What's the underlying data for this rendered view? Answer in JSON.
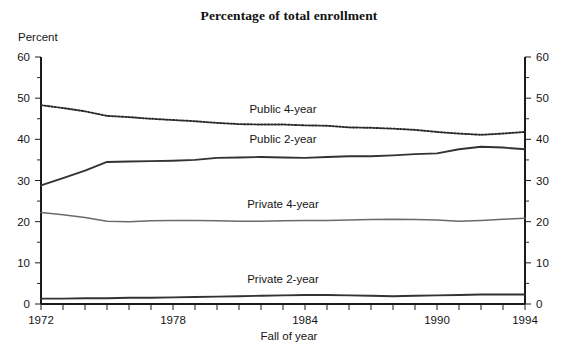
{
  "figure": {
    "title": "Percentage of total enrollment",
    "y_axis_unit_label": "Percent",
    "x_axis_title": "Fall of year"
  },
  "chart_data": {
    "type": "line",
    "title": "Percentage of total enrollment",
    "xlabel": "Fall of year",
    "ylabel": "Percent",
    "xlim": [
      1972,
      1994
    ],
    "ylim": [
      0,
      60
    ],
    "grid": false,
    "legend_position": "inline-labels",
    "y_ticks": [
      0,
      10,
      20,
      30,
      40,
      50,
      60
    ],
    "y_ticks_right": [
      0,
      10,
      20,
      30,
      40,
      50,
      60
    ],
    "x_ticks": [
      1972,
      1973,
      1974,
      1975,
      1976,
      1977,
      1978,
      1979,
      1980,
      1981,
      1982,
      1983,
      1984,
      1985,
      1986,
      1987,
      1988,
      1989,
      1990,
      1991,
      1992,
      1993,
      1994
    ],
    "x_tick_labels": [
      "1972",
      "1978",
      "1984",
      "1990",
      "1994"
    ],
    "x_tick_label_years": [
      1972,
      1978,
      1984,
      1990,
      1994
    ],
    "x": [
      1972,
      1973,
      1974,
      1975,
      1976,
      1977,
      1978,
      1979,
      1980,
      1981,
      1982,
      1983,
      1984,
      1985,
      1986,
      1987,
      1988,
      1989,
      1990,
      1991,
      1992,
      1993,
      1994
    ],
    "series": [
      {
        "name": "Public 4-year",
        "style": "dotted",
        "label_anchor_year": 1983,
        "label_anchor_value": 46.5,
        "values": [
          48.3,
          47.6,
          46.8,
          45.7,
          45.4,
          45.0,
          44.7,
          44.4,
          44.0,
          43.7,
          43.6,
          43.6,
          43.4,
          43.3,
          42.9,
          42.8,
          42.6,
          42.3,
          41.8,
          41.4,
          41.1,
          41.4,
          41.8
        ]
      },
      {
        "name": "Public 2-year",
        "style": "heavy",
        "label_anchor_year": 1983,
        "label_anchor_value": 39.2,
        "values": [
          28.8,
          30.6,
          32.4,
          34.5,
          34.6,
          34.7,
          34.8,
          35.0,
          35.5,
          35.6,
          35.7,
          35.6,
          35.5,
          35.7,
          35.9,
          35.9,
          36.1,
          36.4,
          36.6,
          37.6,
          38.2,
          38.0,
          37.6
        ]
      },
      {
        "name": "Private 4-year",
        "style": "light",
        "label_anchor_year": 1983,
        "label_anchor_value": 23.3,
        "values": [
          22.2,
          21.7,
          21.0,
          20.1,
          20.0,
          20.2,
          20.3,
          20.3,
          20.2,
          20.1,
          20.1,
          20.2,
          20.3,
          20.3,
          20.4,
          20.5,
          20.6,
          20.5,
          20.4,
          20.1,
          20.3,
          20.6,
          20.8
        ]
      },
      {
        "name": "Private 2-year",
        "style": "heavy",
        "label_anchor_year": 1983,
        "label_anchor_value": 5.2,
        "values": [
          1.3,
          1.3,
          1.4,
          1.4,
          1.5,
          1.5,
          1.6,
          1.7,
          1.8,
          1.9,
          2.0,
          2.1,
          2.2,
          2.2,
          2.1,
          2.0,
          1.9,
          2.0,
          2.1,
          2.2,
          2.3,
          2.3,
          2.3
        ]
      }
    ]
  }
}
